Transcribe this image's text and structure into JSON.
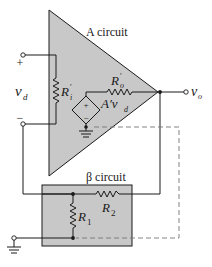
{
  "labels": {
    "a_circuit": "A circuit",
    "beta_circuit": "β circuit",
    "vd_main": "v",
    "vd_sub": "d",
    "plus": "+",
    "minus": "−",
    "ri_main": "R",
    "ri_sub": "i",
    "ri_prime": "′",
    "ro_main": "R",
    "ro_sub": "o",
    "ro_prime": "′",
    "src_main": "A′v",
    "src_sub": "d",
    "vo_main": "v",
    "vo_sub": "o",
    "r1_main": "R",
    "r1_sub": "1",
    "r2_main": "R",
    "r2_sub": "2",
    "src_plus": "+",
    "src_minus": "−"
  },
  "colors": {
    "fill": "#c8c8c8",
    "line": "#1a1a1a",
    "dashed": "#777777"
  }
}
